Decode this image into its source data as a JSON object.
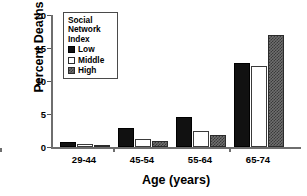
{
  "chart_data": {
    "type": "bar",
    "title": "",
    "xlabel": "Age (years)",
    "ylabel": "Percent Deaths",
    "categories": [
      "29-44",
      "45-54",
      "55-64",
      "65-74"
    ],
    "series": [
      {
        "name": "Low",
        "values": [
          0.8,
          2.9,
          4.6,
          12.7
        ],
        "color": "#111111"
      },
      {
        "name": "Middle",
        "values": [
          0.4,
          1.2,
          2.4,
          12.2
        ],
        "color": "#ffffff"
      },
      {
        "name": "High",
        "values": [
          0.35,
          0.9,
          1.8,
          16.9
        ],
        "color": "#6f6f6f"
      }
    ],
    "ylim": [
      0,
      20
    ],
    "yticks": [
      "0",
      "5",
      "10",
      "15",
      "20"
    ],
    "grid": false,
    "legend_position": "upper-left"
  },
  "legend": {
    "title": "Social\nNetwork\nIndex",
    "entries": [
      {
        "label": "Low"
      },
      {
        "label": "Middle"
      },
      {
        "label": "High"
      }
    ]
  },
  "axes": {
    "ylabel": "Percent Deaths",
    "xlabel": "Age (years)",
    "yticks": [
      "20",
      "15",
      "10",
      "5",
      "0"
    ],
    "xticks": [
      "29-44",
      "45-54",
      "55-64",
      "65-74"
    ]
  }
}
